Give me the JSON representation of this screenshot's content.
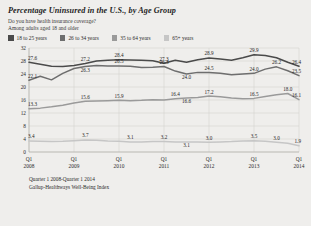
{
  "header": {
    "title": "Percentage Uninsured in the U.S., by Age Group",
    "subtitle1": "Do you have health insurance coverage?",
    "subtitle2": "Among adults aged 18 and older"
  },
  "legend": [
    {
      "label": "18 to 25 years",
      "color": "#4a4a4a"
    },
    {
      "label": "26 to 34 years",
      "color": "#6e6e6e"
    },
    {
      "label": "35 to 64 years",
      "color": "#9a9a9a"
    },
    {
      "label": "65+ years",
      "color": "#c6c6c6"
    }
  ],
  "footer": {
    "range": "Quarter 1 2008-Quarter 1 2014",
    "source": "Gallup-Healthways Well-Being Index"
  },
  "chart_data": {
    "type": "line",
    "title": "Percentage Uninsured in the U.S., by Age Group",
    "xlabel": "",
    "ylabel": "",
    "ylim": [
      0,
      32
    ],
    "yticks": [
      0,
      4,
      8,
      12,
      16,
      20,
      24,
      28,
      32
    ],
    "grid": true,
    "legend_position": "top",
    "x": [
      "Q1 2008",
      "Q2 2008",
      "Q3 2008",
      "Q4 2008",
      "Q1 2009",
      "Q2 2009",
      "Q3 2009",
      "Q4 2009",
      "Q1 2010",
      "Q2 2010",
      "Q3 2010",
      "Q4 2010",
      "Q1 2011",
      "Q2 2011",
      "Q3 2011",
      "Q4 2011",
      "Q1 2012",
      "Q2 2012",
      "Q3 2012",
      "Q4 2012",
      "Q1 2013",
      "Q2 2013",
      "Q3 2013",
      "Q4 2013",
      "Q1 2014"
    ],
    "xtick_labels": [
      {
        "q": "Q1",
        "year": "2008"
      },
      {
        "q": "Q1",
        "year": "2009"
      },
      {
        "q": "Q1",
        "year": "2010"
      },
      {
        "q": "Q1",
        "year": "2011"
      },
      {
        "q": "Q1",
        "year": "2012"
      },
      {
        "q": "Q1",
        "year": "2013"
      },
      {
        "q": "Q1",
        "year": "2014"
      }
    ],
    "series": [
      {
        "name": "18 to 25 years",
        "color": "#4a4a4a",
        "values": [
          27.6,
          27.0,
          26.4,
          26.3,
          26.6,
          27.2,
          28.0,
          28.2,
          28.4,
          28.3,
          28.2,
          28.1,
          27.3,
          28.2,
          27.6,
          28.4,
          28.9,
          28.6,
          28.2,
          29.0,
          29.9,
          29.7,
          29.0,
          27.6,
          26.4
        ],
        "labels": [
          {
            "i": 0,
            "v": "27.6"
          },
          {
            "i": 5,
            "v": "27.2"
          },
          {
            "i": 8,
            "v": "28.4"
          },
          {
            "i": 12,
            "v": "27.3"
          },
          {
            "i": 16,
            "v": "28.9"
          },
          {
            "i": 20,
            "v": "29.9"
          },
          {
            "i": 24,
            "v": "26.4"
          }
        ]
      },
      {
        "name": "26 to 34 years",
        "color": "#6e6e6e",
        "values": [
          22.1,
          23.3,
          22.2,
          24.2,
          25.7,
          26.3,
          26.6,
          26.5,
          26.5,
          26.4,
          26.0,
          26.1,
          26.3,
          24.9,
          24.0,
          24.5,
          24.5,
          24.2,
          23.8,
          24.0,
          24.2,
          25.5,
          26.2,
          25.0,
          23.5
        ],
        "labels": [
          {
            "i": 0,
            "v": "22.1"
          },
          {
            "i": 5,
            "v": "26.3"
          },
          {
            "i": 8,
            "v": "26.5"
          },
          {
            "i": 12,
            "v": "26.3"
          },
          {
            "i": 14,
            "v": "24.0"
          },
          {
            "i": 16,
            "v": "24.5"
          },
          {
            "i": 20,
            "v": "24.0"
          },
          {
            "i": 22,
            "v": "26.2"
          },
          {
            "i": 24,
            "v": "23.5"
          }
        ]
      },
      {
        "name": "35 to 64 years",
        "color": "#9a9a9a",
        "values": [
          13.3,
          13.5,
          13.9,
          14.4,
          15.1,
          15.6,
          15.7,
          15.8,
          15.9,
          15.8,
          15.9,
          16.1,
          16.0,
          16.4,
          16.6,
          16.8,
          17.2,
          17.0,
          16.6,
          16.4,
          16.5,
          17.1,
          17.6,
          18.0,
          16.1
        ],
        "labels": [
          {
            "i": 0,
            "v": "13.3"
          },
          {
            "i": 5,
            "v": "15.6"
          },
          {
            "i": 8,
            "v": "15.9"
          },
          {
            "i": 13,
            "v": "16.4"
          },
          {
            "i": 14,
            "v": "16.6"
          },
          {
            "i": 16,
            "v": "17.2"
          },
          {
            "i": 20,
            "v": "16.5"
          },
          {
            "i": 23,
            "v": "18.0"
          },
          {
            "i": 24,
            "v": "16.1"
          }
        ]
      },
      {
        "name": "65+ years",
        "color": "#c6c6c6",
        "values": [
          3.4,
          3.3,
          3.2,
          3.3,
          3.5,
          3.7,
          3.6,
          3.4,
          3.3,
          3.1,
          3.1,
          3.2,
          3.2,
          3.1,
          3.1,
          3.1,
          3.0,
          3.1,
          3.2,
          3.4,
          3.5,
          3.3,
          3.0,
          2.7,
          1.9
        ],
        "labels": [
          {
            "i": 0,
            "v": "3.4"
          },
          {
            "i": 5,
            "v": "3.7"
          },
          {
            "i": 9,
            "v": "3.1"
          },
          {
            "i": 12,
            "v": "3.2"
          },
          {
            "i": 14,
            "v": "3.1"
          },
          {
            "i": 16,
            "v": "3.0"
          },
          {
            "i": 20,
            "v": "3.5"
          },
          {
            "i": 22,
            "v": "3.0"
          },
          {
            "i": 24,
            "v": "1.9"
          }
        ]
      }
    ]
  }
}
